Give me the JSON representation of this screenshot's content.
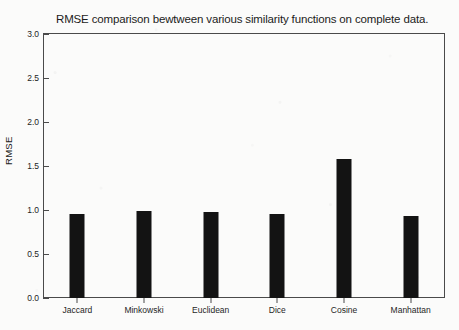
{
  "chart_data": {
    "type": "bar",
    "title": "RMSE comparison bewtween various similarity functions on complete data.",
    "xlabel": "",
    "ylabel": "RMSE",
    "categories": [
      "Jaccard",
      "Minkowski",
      "Euclidean",
      "Dice",
      "Cosine",
      "Manhattan"
    ],
    "values": [
      0.96,
      0.99,
      0.98,
      0.96,
      1.58,
      0.93
    ],
    "series": [
      {
        "name": "RMSE",
        "values": [
          0.96,
          0.99,
          0.98,
          0.96,
          1.58,
          0.93
        ]
      }
    ],
    "ylim": [
      0.0,
      3.0
    ],
    "ytick_labels": [
      "0.0",
      "0.5",
      "1.0",
      "1.5",
      "2.0",
      "2.5",
      "3.0"
    ],
    "ytick_values": [
      0.0,
      0.5,
      1.0,
      1.5,
      2.0,
      2.5,
      3.0
    ],
    "grid": false,
    "legend": false,
    "legend_position": "none",
    "bar_color": "#131313",
    "frame_color": "#4a4a4a",
    "background_color": "#fbfbfa"
  }
}
